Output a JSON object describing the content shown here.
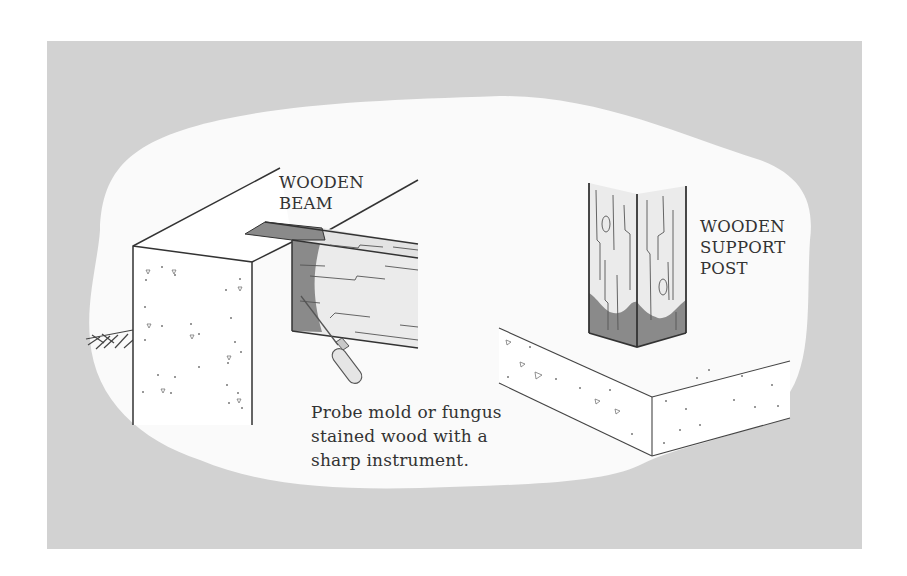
{
  "diagram": {
    "colors": {
      "background_panel": "#d2d2d2",
      "cloud": "#fafafa",
      "line": "#333333",
      "stain": "#8a8a8a",
      "wood": "#ebebeb"
    },
    "labels": {
      "beam": {
        "line1": "WOODEN",
        "line2": "BEAM"
      },
      "post": {
        "line1": "WOODEN",
        "line2": "SUPPORT",
        "line3": "POST"
      },
      "caption": {
        "line1": "Probe mold or fungus",
        "line2": "stained wood with a",
        "line3": "sharp instrument."
      }
    },
    "components": [
      "concrete-foundation-wall",
      "wooden-beam",
      "probe-tool",
      "soil-hatch",
      "wooden-support-post",
      "concrete-slab"
    ]
  }
}
